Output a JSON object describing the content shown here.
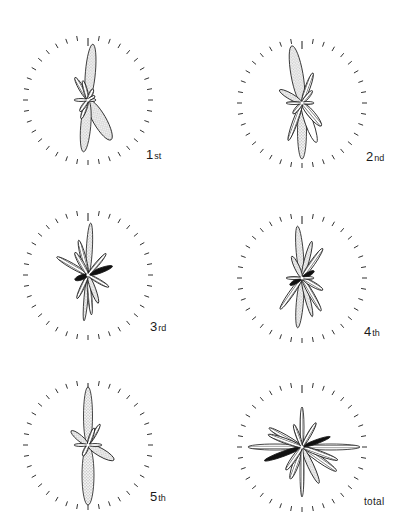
{
  "figure": {
    "type": "rose-diagram-grid",
    "layout": {
      "rows": 3,
      "cols": 2
    },
    "tick_count": 36,
    "legend_fills": [
      "stipple",
      "hatch",
      "blank",
      "solid"
    ],
    "colors": {
      "ink": "#1a1a1a",
      "stipple_bg": "#eeeeee",
      "background": "#ffffff"
    }
  },
  "panels": [
    {
      "id": "1st",
      "label_num": "1",
      "label_suffix": "st",
      "cx": 88,
      "cy": 100,
      "r": 60,
      "label_x": 146,
      "label_y": 148,
      "petals": [
        {
          "angle": 5,
          "len": 56,
          "w": 9,
          "fill": "stipple"
        },
        {
          "angle": 185,
          "len": 52,
          "w": 9,
          "fill": "stipple"
        },
        {
          "angle": 150,
          "len": 46,
          "w": 12,
          "fill": "stipple"
        },
        {
          "angle": 330,
          "len": 26,
          "w": 4,
          "fill": "hatch"
        },
        {
          "angle": 345,
          "len": 20,
          "w": 3,
          "fill": "hatch"
        },
        {
          "angle": 25,
          "len": 12,
          "w": 3,
          "fill": "hatch"
        },
        {
          "angle": 270,
          "len": 14,
          "w": 2,
          "fill": "hatch"
        },
        {
          "angle": 90,
          "len": 8,
          "w": 2,
          "fill": "hatch"
        },
        {
          "angle": 200,
          "len": 20,
          "w": 3,
          "fill": "hatch"
        },
        {
          "angle": 215,
          "len": 14,
          "w": 3,
          "fill": "hatch"
        },
        {
          "angle": 60,
          "len": 8,
          "w": 2,
          "fill": "hatch"
        }
      ]
    },
    {
      "id": "2nd",
      "label_num": "2",
      "label_suffix": "nd",
      "cx": 302,
      "cy": 103,
      "r": 60,
      "label_x": 366,
      "label_y": 150,
      "petals": [
        {
          "angle": 350,
          "len": 58,
          "w": 11,
          "fill": "stipple"
        },
        {
          "angle": 180,
          "len": 56,
          "w": 8,
          "fill": "stipple"
        },
        {
          "angle": 300,
          "len": 26,
          "w": 5,
          "fill": "stipple"
        },
        {
          "angle": 20,
          "len": 32,
          "w": 4,
          "fill": "hatch"
        },
        {
          "angle": 140,
          "len": 30,
          "w": 6,
          "fill": "hatch"
        },
        {
          "angle": 160,
          "len": 42,
          "w": 7,
          "fill": "blank"
        },
        {
          "angle": 200,
          "len": 40,
          "w": 4,
          "fill": "hatch"
        },
        {
          "angle": 270,
          "len": 16,
          "w": 2,
          "fill": "hatch"
        },
        {
          "angle": 90,
          "len": 12,
          "w": 2,
          "fill": "hatch"
        },
        {
          "angle": 40,
          "len": 16,
          "w": 3,
          "fill": "hatch"
        },
        {
          "angle": 220,
          "len": 14,
          "w": 3,
          "fill": "hatch"
        }
      ]
    },
    {
      "id": "3rd",
      "label_num": "3",
      "label_suffix": "rd",
      "cx": 88,
      "cy": 275,
      "r": 60,
      "label_x": 150,
      "label_y": 320,
      "petals": [
        {
          "angle": 3,
          "len": 52,
          "w": 5,
          "fill": "stipple"
        },
        {
          "angle": 185,
          "len": 46,
          "w": 3,
          "fill": "stipple"
        },
        {
          "angle": 345,
          "len": 36,
          "w": 4,
          "fill": "hatch"
        },
        {
          "angle": 300,
          "len": 36,
          "w": 4,
          "fill": "hatch"
        },
        {
          "angle": 330,
          "len": 26,
          "w": 4,
          "fill": "hatch"
        },
        {
          "angle": 40,
          "len": 28,
          "w": 3,
          "fill": "hatch"
        },
        {
          "angle": 70,
          "len": 26,
          "w": 4,
          "fill": "solid"
        },
        {
          "angle": 250,
          "len": 14,
          "w": 4,
          "fill": "solid"
        },
        {
          "angle": 160,
          "len": 30,
          "w": 4,
          "fill": "stipple"
        },
        {
          "angle": 120,
          "len": 24,
          "w": 3,
          "fill": "hatch"
        },
        {
          "angle": 205,
          "len": 26,
          "w": 3,
          "fill": "hatch"
        },
        {
          "angle": 175,
          "len": 40,
          "w": 3,
          "fill": "hatch"
        }
      ]
    },
    {
      "id": "4th",
      "label_num": "4",
      "label_suffix": "th",
      "cx": 302,
      "cy": 278,
      "r": 60,
      "label_x": 364,
      "label_y": 325,
      "petals": [
        {
          "angle": 355,
          "len": 52,
          "w": 6,
          "fill": "stipple"
        },
        {
          "angle": 185,
          "len": 50,
          "w": 6,
          "fill": "stipple"
        },
        {
          "angle": 15,
          "len": 38,
          "w": 4,
          "fill": "stipple"
        },
        {
          "angle": 35,
          "len": 36,
          "w": 4,
          "fill": "hatch"
        },
        {
          "angle": 335,
          "len": 24,
          "w": 4,
          "fill": "stipple"
        },
        {
          "angle": 165,
          "len": 40,
          "w": 4,
          "fill": "stipple"
        },
        {
          "angle": 150,
          "len": 38,
          "w": 4,
          "fill": "hatch"
        },
        {
          "angle": 215,
          "len": 38,
          "w": 4,
          "fill": "hatch"
        },
        {
          "angle": 120,
          "len": 24,
          "w": 4,
          "fill": "hatch"
        },
        {
          "angle": 270,
          "len": 16,
          "w": 2,
          "fill": "hatch"
        },
        {
          "angle": 90,
          "len": 12,
          "w": 2,
          "fill": "hatch"
        },
        {
          "angle": 60,
          "len": 14,
          "w": 3,
          "fill": "solid"
        },
        {
          "angle": 240,
          "len": 14,
          "w": 3,
          "fill": "solid"
        }
      ]
    },
    {
      "id": "5th",
      "label_num": "5",
      "label_suffix": "th",
      "cx": 88,
      "cy": 445,
      "r": 60,
      "label_x": 150,
      "label_y": 490,
      "petals": [
        {
          "angle": 0,
          "len": 58,
          "w": 8,
          "fill": "stipple"
        },
        {
          "angle": 180,
          "len": 60,
          "w": 11,
          "fill": "stipple"
        },
        {
          "angle": 120,
          "len": 30,
          "w": 7,
          "fill": "stipple"
        },
        {
          "angle": 310,
          "len": 22,
          "w": 5,
          "fill": "stipple"
        },
        {
          "angle": 30,
          "len": 24,
          "w": 3,
          "fill": "hatch"
        },
        {
          "angle": 20,
          "len": 18,
          "w": 3,
          "fill": "hatch"
        },
        {
          "angle": 270,
          "len": 14,
          "w": 2,
          "fill": "hatch"
        },
        {
          "angle": 90,
          "len": 14,
          "w": 2,
          "fill": "hatch"
        },
        {
          "angle": 205,
          "len": 12,
          "w": 3,
          "fill": "hatch"
        }
      ]
    },
    {
      "id": "total",
      "label_num": "total",
      "label_suffix": "",
      "cx": 302,
      "cy": 447,
      "r": 60,
      "label_x": 364,
      "label_y": 497,
      "petals": [
        {
          "angle": 0,
          "len": 40,
          "w": 3,
          "fill": "hatch"
        },
        {
          "angle": 180,
          "len": 50,
          "w": 3,
          "fill": "hatch"
        },
        {
          "angle": 270,
          "len": 54,
          "w": 5,
          "fill": "hatch"
        },
        {
          "angle": 90,
          "len": 58,
          "w": 5,
          "fill": "hatch"
        },
        {
          "angle": 300,
          "len": 38,
          "w": 4,
          "fill": "hatch"
        },
        {
          "angle": 290,
          "len": 36,
          "w": 4,
          "fill": "hatch"
        },
        {
          "angle": 30,
          "len": 28,
          "w": 3,
          "fill": "hatch"
        },
        {
          "angle": 340,
          "len": 24,
          "w": 3,
          "fill": "hatch"
        },
        {
          "angle": 70,
          "len": 30,
          "w": 3,
          "fill": "solid"
        },
        {
          "angle": 250,
          "len": 40,
          "w": 4,
          "fill": "solid"
        },
        {
          "angle": 110,
          "len": 38,
          "w": 4,
          "fill": "hatch"
        },
        {
          "angle": 125,
          "len": 42,
          "w": 5,
          "fill": "hatch"
        },
        {
          "angle": 155,
          "len": 40,
          "w": 5,
          "fill": "stipple"
        },
        {
          "angle": 200,
          "len": 34,
          "w": 5,
          "fill": "hatch"
        },
        {
          "angle": 215,
          "len": 28,
          "w": 4,
          "fill": "hatch"
        }
      ]
    }
  ]
}
